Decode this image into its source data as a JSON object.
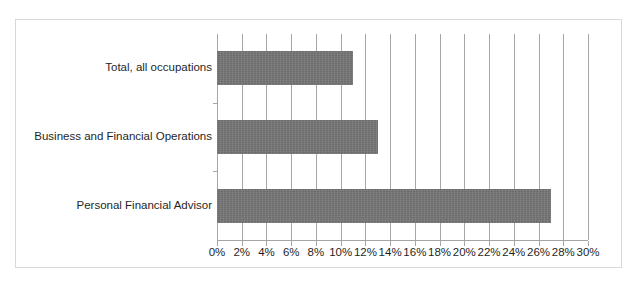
{
  "chart": {
    "title": "",
    "title_note": "title clipped off top edge of screenshot; illegible",
    "background_color": "#ffffff",
    "frame_border_color": "#d9d9d9",
    "gridline_color": "#a6a6a6",
    "bar_color": "#757575",
    "label_color": "#1f1f1f"
  },
  "chart_data": {
    "type": "bar",
    "orientation": "horizontal",
    "title": "",
    "xlabel": "",
    "ylabel": "",
    "xlim": [
      0,
      30
    ],
    "grid": true,
    "legend": false,
    "categories": [
      "Total, all occupations",
      "Business and Financial Operations",
      "Personal Financial Advisor"
    ],
    "values": [
      11,
      13,
      27
    ],
    "value_labels": [
      "11%",
      "13%",
      "27%"
    ],
    "tick_values": [
      0,
      2,
      4,
      6,
      8,
      10,
      12,
      14,
      16,
      18,
      20,
      22,
      24,
      26,
      28,
      30
    ],
    "tick_labels": [
      "0%",
      "2%",
      "4%",
      "6%",
      "8%",
      "10%",
      "12%",
      "14%",
      "16%",
      "18%",
      "20%",
      "22%",
      "24%",
      "26%",
      "28%",
      "30%"
    ]
  }
}
